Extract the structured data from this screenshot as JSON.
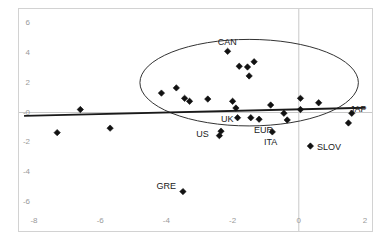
{
  "chart_data": {
    "type": "scatter",
    "title": "",
    "xlabel": "",
    "ylabel": "",
    "xlim": [
      -8.8,
      2.2
    ],
    "ylim": [
      -6.8,
      6.6
    ],
    "grid": false,
    "legend": null,
    "xticks": [
      "-8",
      "-6",
      "-4",
      "-2",
      "0",
      "2"
    ],
    "xtick_values": [
      -8,
      -6,
      -4,
      -2,
      0,
      2
    ],
    "yticks": [
      "6",
      "4",
      "2",
      "-0",
      "-2",
      "-4",
      "-6"
    ],
    "ytick_values": [
      6,
      4,
      2,
      0,
      -2,
      -4,
      -6
    ],
    "points": [
      {
        "x": -7.3,
        "y": -1.35,
        "label": ""
      },
      {
        "x": -6.6,
        "y": 0.2,
        "label": ""
      },
      {
        "x": -5.7,
        "y": -1.05,
        "label": ""
      },
      {
        "x": -4.15,
        "y": 1.3,
        "label": ""
      },
      {
        "x": -3.7,
        "y": 1.65,
        "label": ""
      },
      {
        "x": -3.45,
        "y": 0.95,
        "label": ""
      },
      {
        "x": -3.3,
        "y": 0.75,
        "label": ""
      },
      {
        "x": -3.5,
        "y": -5.3,
        "label": "GRE"
      },
      {
        "x": -2.75,
        "y": 0.9,
        "label": ""
      },
      {
        "x": -2.35,
        "y": -1.25,
        "label": ""
      },
      {
        "x": -2.4,
        "y": -1.55,
        "label": "US"
      },
      {
        "x": -2.15,
        "y": 4.1,
        "label": "CAN"
      },
      {
        "x": -2.0,
        "y": 0.75,
        "label": ""
      },
      {
        "x": -1.9,
        "y": 0.3,
        "label": ""
      },
      {
        "x": -1.85,
        "y": -0.35,
        "label": "UK"
      },
      {
        "x": -1.8,
        "y": 3.1,
        "label": ""
      },
      {
        "x": -1.55,
        "y": 3.05,
        "label": ""
      },
      {
        "x": -1.5,
        "y": 2.45,
        "label": ""
      },
      {
        "x": -1.35,
        "y": 3.4,
        "label": ""
      },
      {
        "x": -1.45,
        "y": -0.35,
        "label": ""
      },
      {
        "x": -1.2,
        "y": -0.45,
        "label": "EUR"
      },
      {
        "x": -0.85,
        "y": 0.5,
        "label": ""
      },
      {
        "x": -0.8,
        "y": -1.3,
        "label": "ITA"
      },
      {
        "x": -0.45,
        "y": -0.05,
        "label": ""
      },
      {
        "x": -0.35,
        "y": -0.5,
        "label": ""
      },
      {
        "x": 0.05,
        "y": 0.95,
        "label": ""
      },
      {
        "x": 0.05,
        "y": 0.2,
        "label": ""
      },
      {
        "x": 0.35,
        "y": -2.25,
        "label": "SLOV"
      },
      {
        "x": 0.6,
        "y": 0.65,
        "label": ""
      },
      {
        "x": 1.6,
        "y": -0.05,
        "label": "JAP"
      },
      {
        "x": 1.5,
        "y": -0.7,
        "label": ""
      }
    ],
    "trend_line": {
      "name": "regression-line",
      "x_start": -8.3,
      "y_start": -0.22,
      "x_end": 2.0,
      "y_end": 0.32,
      "color": "#1a1a1a"
    },
    "zero_line": {
      "name": "horizontal-zero-axis",
      "y": 0,
      "color": "#c8c8c8"
    },
    "vertical_zero_line": {
      "name": "vertical-zero-axis",
      "x": 0,
      "color": "#c8c8c8"
    },
    "ellipse_annotation": {
      "name": "cluster-ellipse",
      "center_x": -1.5,
      "center_y": 2.0,
      "radius_x": 3.3,
      "radius_y": 2.9,
      "color": "#333333"
    },
    "point_labels": [
      {
        "text": "CAN",
        "x": -2.45,
        "y": 4.75
      },
      {
        "text": "UK",
        "x": -2.35,
        "y": -0.45
      },
      {
        "text": "EUR",
        "x": -1.35,
        "y": -1.15
      },
      {
        "text": "US",
        "x": -3.1,
        "y": -1.45
      },
      {
        "text": "ITA",
        "x": -1.05,
        "y": -2.0
      },
      {
        "text": "SLOV",
        "x": 0.55,
        "y": -2.3
      },
      {
        "text": "JAP",
        "x": 1.55,
        "y": 0.25
      },
      {
        "text": "GRE",
        "x": -4.3,
        "y": -4.9
      }
    ],
    "marker": {
      "shape": "diamond",
      "size": 3.2,
      "color": "#111111"
    },
    "axis_color": "#9a9a9a",
    "frame_color": "#d2d2d2",
    "background": "#ffffff"
  }
}
